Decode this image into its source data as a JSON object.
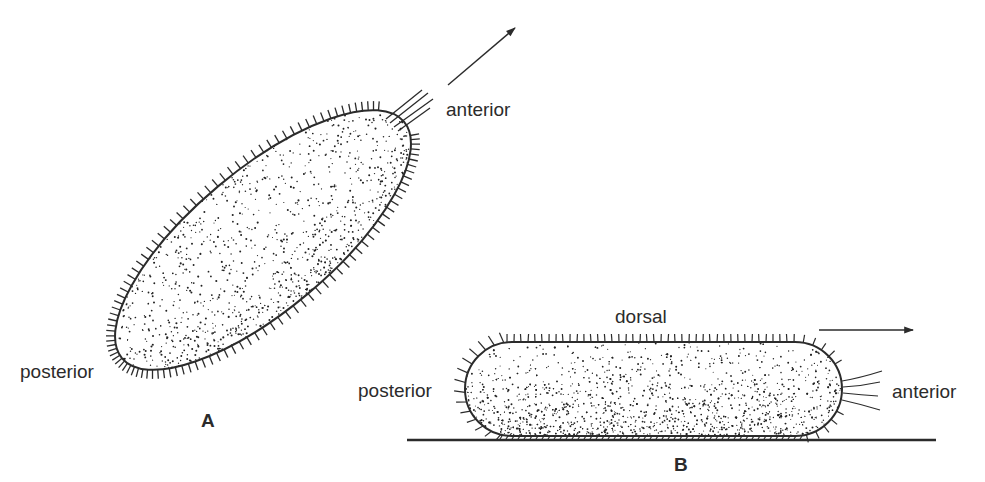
{
  "figure": {
    "panel_a": {
      "letter": "A",
      "labels": {
        "anterior": "anterior",
        "posterior": "posterior"
      },
      "cell": {
        "shape": "ellipse",
        "cx": 263,
        "cy": 240,
        "rx": 184,
        "ry": 70,
        "rotation_deg": -40
      },
      "motion_arrow": {
        "x1": 448,
        "y1": 85,
        "x2": 515,
        "y2": 28
      }
    },
    "panel_b": {
      "letter": "B",
      "labels": {
        "dorsal": "dorsal",
        "anterior": "anterior",
        "posterior": "posterior"
      },
      "cell": {
        "shape": "capsule",
        "x": 465,
        "y": 342,
        "width": 377,
        "height": 94
      },
      "substrate_line": {
        "x1": 407,
        "x2": 936,
        "y": 440
      },
      "motion_arrow": {
        "x1": 819,
        "y1": 330,
        "x2": 913,
        "y2": 330
      }
    },
    "colors": {
      "ink": "#2b2b2b",
      "background": "#ffffff"
    }
  }
}
